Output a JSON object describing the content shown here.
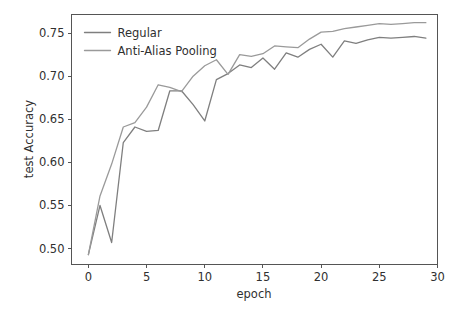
{
  "chart_data": {
    "type": "line",
    "title": "",
    "xlabel": "epoch",
    "ylabel": "test Accuracy",
    "xlim": [
      -1.45,
      30.0
    ],
    "ylim": [
      0.4815,
      0.7715
    ],
    "xticks": [
      0,
      5,
      10,
      15,
      20,
      25,
      30
    ],
    "xtick_labels": [
      "0",
      "5",
      "10",
      "15",
      "20",
      "25",
      "30"
    ],
    "yticks": [
      0.5,
      0.55,
      0.6,
      0.65,
      0.7,
      0.75
    ],
    "ytick_labels": [
      "0.50",
      "0.55",
      "0.60",
      "0.65",
      "0.70",
      "0.75"
    ],
    "grid": false,
    "legend_position": "upper left",
    "x": [
      0,
      1,
      2,
      3,
      4,
      5,
      6,
      7,
      8,
      9,
      10,
      11,
      12,
      13,
      14,
      15,
      16,
      17,
      18,
      19,
      20,
      21,
      22,
      23,
      24,
      25,
      26,
      27,
      28,
      29
    ],
    "series": [
      {
        "name": "Regular",
        "color": "#7f7f7f",
        "values": [
          0.493,
          0.55,
          0.507,
          0.623,
          0.641,
          0.636,
          0.637,
          0.683,
          0.683,
          0.667,
          0.648,
          0.696,
          0.703,
          0.713,
          0.71,
          0.721,
          0.708,
          0.727,
          0.722,
          0.731,
          0.737,
          0.722,
          0.741,
          0.738,
          0.742,
          0.745,
          0.744,
          0.745,
          0.746,
          0.744
        ]
      },
      {
        "name": "Anti-Alias Pooling",
        "color": "#9a9a9a",
        "values": [
          0.493,
          0.561,
          0.598,
          0.641,
          0.646,
          0.664,
          0.69,
          0.687,
          0.682,
          0.7,
          0.712,
          0.719,
          0.702,
          0.725,
          0.723,
          0.726,
          0.735,
          0.734,
          0.733,
          0.743,
          0.751,
          0.752,
          0.755,
          0.757,
          0.759,
          0.761,
          0.76,
          0.761,
          0.762,
          0.762
        ]
      }
    ]
  },
  "legend": {
    "entries": [
      {
        "label": "Regular"
      },
      {
        "label": "Anti-Alias Pooling"
      }
    ]
  },
  "axes": {
    "x_label": "epoch",
    "y_label": "test Accuracy"
  }
}
